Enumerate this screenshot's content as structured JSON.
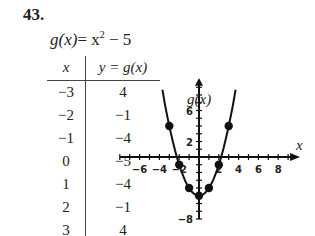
{
  "problem": {
    "number": "43."
  },
  "function": {
    "lhs": "g(x)",
    "rhs": "= x",
    "exp": "2",
    "tail": " − 5",
    "label": "g(x) = x^2 − 5"
  },
  "table": {
    "headers": [
      "x",
      "y = g(x)"
    ],
    "rows": [
      [
        "−3",
        "4"
      ],
      [
        "−2",
        "−1"
      ],
      [
        "−1",
        "−4"
      ],
      [
        "0",
        "−5"
      ],
      [
        "1",
        "−4"
      ],
      [
        "2",
        "−1"
      ],
      [
        "3",
        "4"
      ]
    ]
  },
  "graph": {
    "y_axis_label": "g(x)",
    "x_axis_label": "x",
    "x_tick_labels": [
      "−6",
      "−4",
      "−2",
      "2",
      "4",
      "6",
      "8"
    ],
    "y_tick_labels": [
      "6",
      "2",
      "−8"
    ]
  },
  "chart_data": {
    "type": "line",
    "xlabel": "x",
    "ylabel": "g(x)",
    "x": [
      -3,
      -2,
      -1,
      0,
      1,
      2,
      3
    ],
    "series": [
      {
        "name": "g(x) = x^2 − 5",
        "values": [
          4,
          -1,
          -4,
          -5,
          -4,
          -1,
          4
        ]
      }
    ],
    "curve": "parabola y = x^2 − 5",
    "xlim": [
      -8,
      10
    ],
    "ylim": [
      -8,
      10
    ],
    "x_ticks_labeled": [
      -6,
      -4,
      -2,
      2,
      4,
      6,
      8
    ],
    "y_ticks_labeled": [
      6,
      2,
      -8
    ],
    "grid": false,
    "markers": true,
    "legend": null
  }
}
